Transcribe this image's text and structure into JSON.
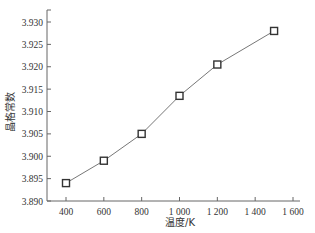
{
  "chart_data": {
    "type": "line",
    "title": "",
    "xlabel": "温度/K",
    "ylabel": "晶格常数",
    "x": [
      400,
      600,
      800,
      1000,
      1200,
      1500
    ],
    "series": [
      {
        "name": "晶格常数",
        "values": [
          3.894,
          3.899,
          3.905,
          3.9135,
          3.9205,
          3.928
        ],
        "marker": "open-square",
        "color": "#555555"
      }
    ],
    "xlim": [
      300,
      1600
    ],
    "ylim": [
      3.89,
      3.932
    ],
    "xticks": [
      400,
      600,
      800,
      1000,
      1200,
      1400,
      1600
    ],
    "xtick_labels": [
      "400",
      "600",
      "800",
      "1 000",
      "1 200",
      "1 400",
      "1 600"
    ],
    "yticks": [
      3.89,
      3.895,
      3.9,
      3.905,
      3.91,
      3.915,
      3.92,
      3.925,
      3.93
    ],
    "ytick_labels": [
      "3.890",
      "3.895",
      "3.900",
      "3.905",
      "3.910",
      "3.915",
      "3.920",
      "3.925",
      "3.930"
    ],
    "grid": false,
    "legend": "none"
  }
}
